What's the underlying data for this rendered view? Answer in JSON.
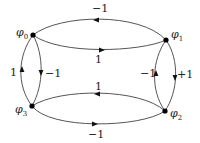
{
  "diagram": {
    "nodes": [
      {
        "id": "phi0",
        "label": "φ",
        "sub": "0"
      },
      {
        "id": "phi1",
        "label": "φ",
        "sub": "1"
      },
      {
        "id": "phi2",
        "label": "φ",
        "sub": "2"
      },
      {
        "id": "phi3",
        "label": "φ",
        "sub": "3"
      }
    ],
    "edges": [
      {
        "from": "phi1",
        "to": "phi0",
        "label": "−1",
        "position": "top-outer"
      },
      {
        "from": "phi0",
        "to": "phi1",
        "label": "1",
        "position": "top-inner"
      },
      {
        "from": "phi2",
        "to": "phi3",
        "label": "1",
        "position": "bottom-inner"
      },
      {
        "from": "phi3",
        "to": "phi2",
        "label": "−1",
        "position": "bottom-outer"
      },
      {
        "from": "phi3",
        "to": "phi0",
        "label": "1",
        "position": "left-outer"
      },
      {
        "from": "phi0",
        "to": "phi3",
        "label": "−1",
        "position": "left-inner"
      },
      {
        "from": "phi2",
        "to": "phi1",
        "label": "−1",
        "position": "right-inner"
      },
      {
        "from": "phi1",
        "to": "phi2",
        "label": "+1",
        "position": "right-outer"
      }
    ],
    "colors": {
      "edge": "#555555",
      "node": "#000000",
      "text": "#222222"
    }
  }
}
